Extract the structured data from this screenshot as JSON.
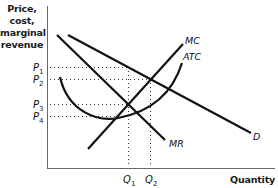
{
  "diagram": {
    "y_axis_label": [
      "Price,",
      "cost,",
      "marginal",
      "revenue"
    ],
    "x_axis_label": "Quantity",
    "curves": {
      "mc": "MC",
      "atc": "ATC",
      "demand": "D",
      "mr": "MR"
    },
    "price_levels": {
      "p1": {
        "main": "P",
        "sub": "1"
      },
      "p2": {
        "main": "P",
        "sub": "2"
      },
      "p3": {
        "main": "P",
        "sub": "3"
      },
      "p4": {
        "main": "P",
        "sub": "4"
      }
    },
    "quantity_levels": {
      "q1": {
        "main": "Q",
        "sub": "1"
      },
      "q2": {
        "main": "Q",
        "sub": "2"
      }
    },
    "colors": {
      "line": "#111111",
      "guide": "#333333",
      "axis": "#555555"
    }
  }
}
